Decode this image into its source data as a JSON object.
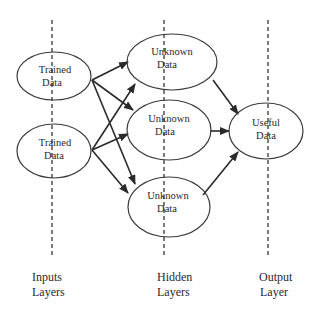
{
  "diagram": {
    "type": "neural-network",
    "layers": [
      {
        "id": "input",
        "label_line1": "Inputs",
        "label_line2": "Layers",
        "x": 52
      },
      {
        "id": "hidden",
        "label_line1": "Hidden",
        "label_line2": "Layers",
        "x": 164
      },
      {
        "id": "output",
        "label_line1": "Output",
        "label_line2": "Layer",
        "x": 268
      }
    ],
    "nodes": [
      {
        "id": "in1",
        "layer": "input",
        "line1": "Trained",
        "line2": "Data"
      },
      {
        "id": "in2",
        "layer": "input",
        "line1": "Trained",
        "line2": "Data"
      },
      {
        "id": "h1",
        "layer": "hidden",
        "line1": "Unknown",
        "line2": "Data"
      },
      {
        "id": "h2",
        "layer": "hidden",
        "line1": "Unknown",
        "line2": "Data"
      },
      {
        "id": "h3",
        "layer": "hidden",
        "line1": "Unknown",
        "line2": "Data"
      },
      {
        "id": "out1",
        "layer": "output",
        "line1": "Useful",
        "line2": "Data"
      }
    ],
    "edges": [
      {
        "from": "in1",
        "to": "h1"
      },
      {
        "from": "in1",
        "to": "h2"
      },
      {
        "from": "in1",
        "to": "h3"
      },
      {
        "from": "in2",
        "to": "h1"
      },
      {
        "from": "in2",
        "to": "h2"
      },
      {
        "from": "in2",
        "to": "h3"
      },
      {
        "from": "h1",
        "to": "out1"
      },
      {
        "from": "h2",
        "to": "out1"
      },
      {
        "from": "h3",
        "to": "out1"
      }
    ],
    "colors": {
      "stroke": "#2a2a2a",
      "background": "#ffffff"
    }
  }
}
